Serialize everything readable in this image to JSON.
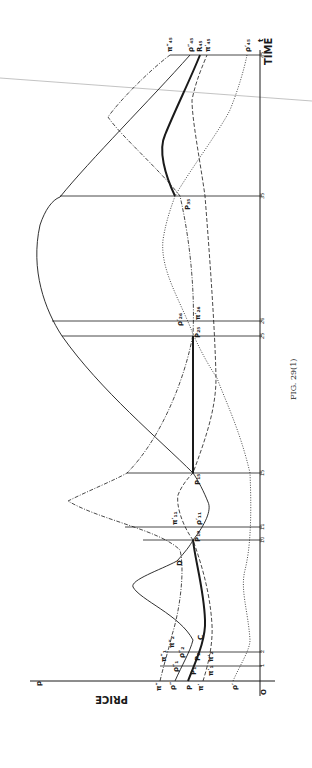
{
  "figure": {
    "caption": "FIG. 29(1)",
    "orientation": "rotated 90° counter-clockwise (time axis runs upward along right edge, price axis runs leftward along bottom)"
  },
  "axes": {
    "price_symbol": "p",
    "price_label": "PRICE",
    "time_symbol": "t",
    "time_label": "TIME",
    "origin_label": "O",
    "time_ticks": [
      "1",
      "2",
      "10",
      "11",
      "15",
      "25",
      "26",
      "35",
      "45"
    ]
  },
  "curve_labels": {
    "t0": {
      "pi_dd": "π″",
      "rho_dd": "ρ″",
      "P": "P",
      "pi_d": "π′",
      "rho_d": "ρ′"
    },
    "t1": {
      "pi_dd": "π″₁",
      "rho_dd": "ρ″₁",
      "P": "P₁",
      "pi_d": "π′₁"
    },
    "t2": {
      "pi_dd": "π″₂",
      "rho_dd": "ρ″₂",
      "P": "P₂",
      "pi_d": "π′₂"
    },
    "point_C": "C",
    "point_D": "D",
    "t10": {
      "P": "P₁₀"
    },
    "t11": {
      "pi_d": "π′₁₁",
      "rho_d": "ρ′₁₁"
    },
    "t15": {
      "P": "P₁₅"
    },
    "t25": {
      "P": "P₂₅"
    },
    "t26": {
      "rho_d": "ρ′₂₆",
      "pi_d": "π′₂₆"
    },
    "t35": {
      "P": "P₃₅"
    },
    "t45": {
      "pi_dd": "π″₄₅",
      "rho_dd": "ρ″₄₅",
      "R": "R₄₅",
      "pi_d": "π′₄₅",
      "rho_d": "ρ′₄₅"
    }
  },
  "legend_styles": {
    "P_path": "thick solid",
    "rho_dd": "thin solid",
    "pi_dd": "dash-dot",
    "pi_d": "dashed",
    "rho_d": "dotted"
  },
  "colors": {
    "ink": "#1a1a1a",
    "paper": "#ffffff",
    "scan_line": "#9a9a9a"
  }
}
